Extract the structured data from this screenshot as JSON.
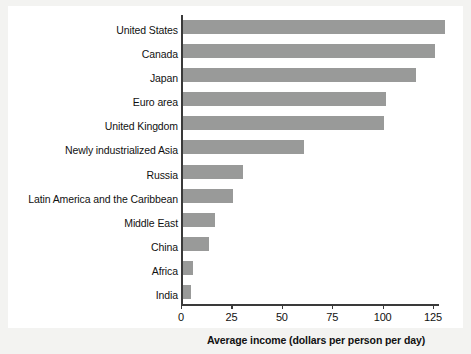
{
  "chart_data": {
    "type": "bar",
    "orientation": "horizontal",
    "title": "",
    "xlabel": "Average income (dollars per person per day)",
    "ylabel": "",
    "categories": [
      "United States",
      "Canada",
      "Japan",
      "Euro area",
      "United Kingdom",
      "Newly industrialized Asia",
      "Russia",
      "Latin America and the Caribbean",
      "Middle East",
      "China",
      "Africa",
      "India"
    ],
    "values": [
      130,
      125,
      116,
      101,
      100,
      60,
      30,
      25,
      16,
      13,
      5,
      4
    ],
    "xlim": [
      0,
      132
    ],
    "xticks": [
      0,
      25,
      50,
      75,
      100,
      125
    ],
    "xtick_labels": [
      "0",
      "25",
      "50",
      "75",
      "100",
      "125"
    ],
    "grid": false,
    "legend": null,
    "bar_color": "#999a99",
    "axis_color": "#3a3a3a",
    "plot_background": "#ffffff",
    "page_background": "#f3f3f1"
  }
}
